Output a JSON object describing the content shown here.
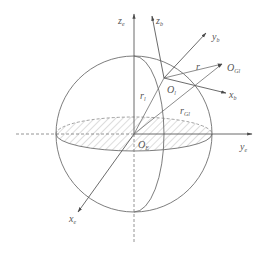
{
  "figure": {
    "type": "coordinate-frame-diagram",
    "colors": {
      "line": "#6e6e6e",
      "axis": "#5a5a5a",
      "hatch": "#cfcfcf",
      "text": "#555555"
    },
    "earth_frame": {
      "origin": {
        "main": "O",
        "sub": "E"
      },
      "x_axis": {
        "main": "x",
        "sub": "e"
      },
      "y_axis": {
        "main": "y",
        "sub": "e"
      },
      "z_axis": {
        "main": "z",
        "sub": "e"
      }
    },
    "body_frame": {
      "origin": {
        "main": "O",
        "sub": "l"
      },
      "x_axis": {
        "main": "x",
        "sub": "b"
      },
      "y_axis": {
        "main": "y",
        "sub": "b"
      },
      "z_axis": {
        "main": "z",
        "sub": "b"
      }
    },
    "target_point": {
      "main": "O",
      "sub": "Gl"
    },
    "vectors": {
      "r": {
        "main": "r",
        "sub": ""
      },
      "r_l": {
        "main": "r",
        "sub": "l"
      },
      "r_Gl": {
        "main": "r",
        "sub": "Gl"
      }
    }
  }
}
